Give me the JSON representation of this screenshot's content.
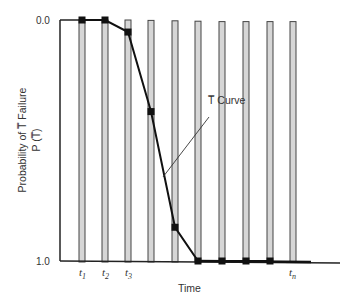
{
  "chart_data": {
    "type": "line",
    "title": "",
    "xlabel": "Time",
    "ylabel": "Probability of T̅ Failure",
    "ylabel_sub": "P (T̅)",
    "ylim": [
      0.0,
      1.0
    ],
    "y_inverted": true,
    "y_ticks": [
      "0.0",
      "1.0"
    ],
    "x_tick_labels": [
      {
        "index": 0,
        "label": "t",
        "sub": "1"
      },
      {
        "index": 1,
        "label": "t",
        "sub": "2"
      },
      {
        "index": 2,
        "label": "t",
        "sub": "3"
      },
      {
        "index": 9,
        "label": "t",
        "sub": "n"
      }
    ],
    "bars": {
      "count": 10,
      "description": "shaded vertical time-interval bars spanning full probability range"
    },
    "series": [
      {
        "name": "T̅ Curve",
        "x": [
          "t1",
          "t2",
          "t3",
          "t4",
          "t5",
          "t6",
          "t7",
          "t8",
          "t9"
        ],
        "values": [
          0.0,
          0.0,
          0.05,
          0.38,
          0.86,
          1.0,
          1.0,
          1.0,
          1.0
        ]
      }
    ],
    "annotations": [
      {
        "text": "T̅ Curve",
        "points_to": "segment between t4 and t5"
      }
    ],
    "grid": false,
    "legend": "none"
  },
  "labels": {
    "y_top": "0.0",
    "y_bottom": "1.0",
    "x_axis": "Time",
    "y_axis_line1": "Probability of T̅ Failure",
    "y_axis_line2": "P (T̅)",
    "curve_annotation": "T̅ Curve",
    "t1": "t",
    "t1_sub": "1",
    "t2": "t",
    "t2_sub": "2",
    "t3": "t",
    "t3_sub": "3",
    "tn": "t",
    "tn_sub": "n"
  }
}
